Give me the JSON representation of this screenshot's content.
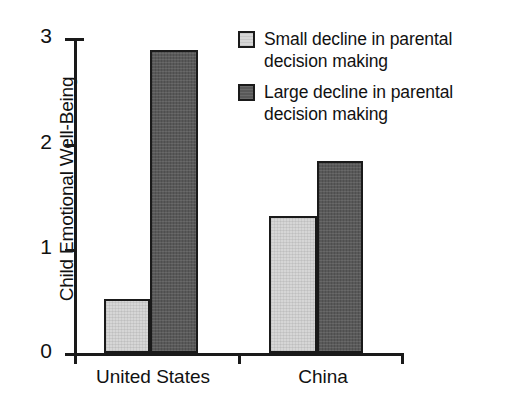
{
  "chart_data": {
    "type": "bar",
    "title": "",
    "subtitle": "",
    "xlabel": "",
    "ylabel": "Child Emotional Well-Being",
    "categories": [
      "United States",
      "China"
    ],
    "series": [
      {
        "name": "Small decline in parental decision making",
        "values": [
          0.51,
          1.3
        ],
        "color": "#d6d6d6"
      },
      {
        "name": "Large decline in parental decision making",
        "values": [
          2.89,
          1.83
        ],
        "color": "#595959"
      }
    ],
    "ylim": [
      0,
      3
    ],
    "yticks": [
      0,
      1,
      2,
      3
    ],
    "ytick_labels": [
      "0",
      "1",
      "2",
      "3"
    ],
    "grid": false,
    "legend_position": "top-right",
    "axis_color": "#1a1a1a",
    "bar_border_color": "#1a1a1a",
    "background": "#ffffff"
  },
  "legend": {
    "items": [
      {
        "label_line1": "Small decline in parental",
        "label_line2": "decision making",
        "swatch": "light-gray-swatch"
      },
      {
        "label_line1": "Large decline in parental",
        "label_line2": "decision making",
        "swatch": "dark-gray-swatch"
      }
    ]
  }
}
